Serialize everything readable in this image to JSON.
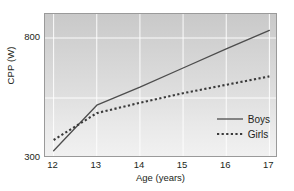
{
  "chart_data": {
    "type": "line",
    "title": "",
    "xlabel": "Age (years)",
    "ylabel": "CPP (W)",
    "xlim": [
      11.8,
      17.2
    ],
    "ylim": [
      300,
      900
    ],
    "xticks": [
      "12",
      "13",
      "14",
      "15",
      "16",
      "17"
    ],
    "xtick_values": [
      12,
      13,
      14,
      15,
      16,
      17
    ],
    "yticks": [
      "300",
      "800"
    ],
    "ytick_values": [
      300,
      800
    ],
    "grid": true,
    "gridlines_x": [
      12,
      13,
      14,
      15,
      16,
      17
    ],
    "gridlines_y": [
      800,
      550
    ],
    "legend_position": "bottom-right",
    "x": [
      12,
      13,
      14,
      15,
      16,
      17
    ],
    "series": [
      {
        "name": "Boys",
        "style": "solid",
        "color": "#4d4d4d",
        "values": [
          330,
          520,
          595,
          675,
          755,
          832
        ]
      },
      {
        "name": "Girls",
        "style": "dotted",
        "color": "#3a3a3a",
        "values": [
          375,
          487,
          530,
          570,
          605,
          640
        ]
      }
    ]
  },
  "axes": {
    "y_title": "CPP (W)",
    "x_title": "Age (years)"
  },
  "legend": {
    "items": [
      {
        "label": "Boys",
        "style": "solid"
      },
      {
        "label": "Girls",
        "style": "dotted"
      }
    ]
  },
  "page": {
    "cut_caption": "a faint partially-cropped line of body text"
  }
}
